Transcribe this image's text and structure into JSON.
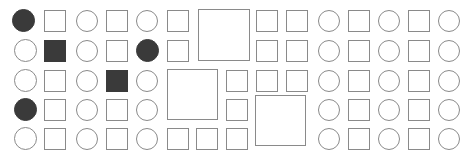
{
  "canvas": {
    "width": 470,
    "height": 159,
    "background": "#ffffff",
    "title": "shape-grid-pattern"
  },
  "style": {
    "outline_color": "#8a8a8a",
    "outline_width": 1,
    "fill_dark": "#3a3a3a",
    "fill_light": "#ffffff",
    "big_outline_color": "#8a8a8a",
    "big_outline_width": 1
  },
  "grid": {
    "rows": 5,
    "cols": 14,
    "cell_pitch_x": 30,
    "cell_pitch_y": 30,
    "origin_x": 10,
    "origin_y": 9,
    "small_size": 22,
    "column_x": [
      10,
      40,
      70,
      100,
      130,
      160,
      190,
      220,
      250,
      280,
      310,
      340,
      370,
      400,
      430
    ],
    "row_y": [
      9,
      39,
      69,
      99,
      128
    ]
  },
  "shapes": [
    {
      "id": "r0c0",
      "row": 0,
      "col": 0,
      "type": "circle",
      "fill": "dark",
      "x": 12,
      "y": 9,
      "size": 23
    },
    {
      "id": "r0c1",
      "row": 0,
      "col": 1,
      "type": "square",
      "fill": "light",
      "x": 44,
      "y": 10,
      "size": 22
    },
    {
      "id": "r0c2",
      "row": 0,
      "col": 2,
      "type": "circle",
      "fill": "light",
      "x": 76,
      "y": 10,
      "size": 22
    },
    {
      "id": "r0c3",
      "row": 0,
      "col": 3,
      "type": "square",
      "fill": "light",
      "x": 106,
      "y": 10,
      "size": 22
    },
    {
      "id": "r0c4",
      "row": 0,
      "col": 4,
      "type": "circle",
      "fill": "light",
      "x": 136,
      "y": 10,
      "size": 22
    },
    {
      "id": "r0c5",
      "row": 0,
      "col": 5,
      "type": "square",
      "fill": "light",
      "x": 167,
      "y": 10,
      "size": 22
    },
    {
      "id": "r0c7",
      "row": 0,
      "col": 7,
      "type": "square",
      "fill": "light",
      "x": 256,
      "y": 10,
      "size": 22
    },
    {
      "id": "r0c8",
      "row": 0,
      "col": 8,
      "type": "square",
      "fill": "light",
      "x": 286,
      "y": 10,
      "size": 22
    },
    {
      "id": "r0c9",
      "row": 0,
      "col": 9,
      "type": "circle",
      "fill": "light",
      "x": 318,
      "y": 10,
      "size": 22
    },
    {
      "id": "r0c10",
      "row": 0,
      "col": 10,
      "type": "square",
      "fill": "light",
      "x": 348,
      "y": 10,
      "size": 22
    },
    {
      "id": "r0c11",
      "row": 0,
      "col": 11,
      "type": "circle",
      "fill": "light",
      "x": 378,
      "y": 10,
      "size": 22
    },
    {
      "id": "r0c12",
      "row": 0,
      "col": 12,
      "type": "square",
      "fill": "light",
      "x": 408,
      "y": 10,
      "size": 22
    },
    {
      "id": "r0c13",
      "row": 0,
      "col": 13,
      "type": "circle",
      "fill": "light",
      "x": 438,
      "y": 10,
      "size": 22
    },
    {
      "id": "r1c0",
      "row": 1,
      "col": 0,
      "type": "circle",
      "fill": "light",
      "x": 14,
      "y": 39,
      "size": 23
    },
    {
      "id": "r1c1",
      "row": 1,
      "col": 1,
      "type": "square",
      "fill": "dark",
      "x": 44,
      "y": 40,
      "size": 22
    },
    {
      "id": "r1c2",
      "row": 1,
      "col": 2,
      "type": "circle",
      "fill": "light",
      "x": 76,
      "y": 40,
      "size": 22
    },
    {
      "id": "r1c3",
      "row": 1,
      "col": 3,
      "type": "square",
      "fill": "light",
      "x": 106,
      "y": 40,
      "size": 22
    },
    {
      "id": "r1c4",
      "row": 1,
      "col": 4,
      "type": "circle",
      "fill": "dark",
      "x": 136,
      "y": 39,
      "size": 23
    },
    {
      "id": "r1c5",
      "row": 1,
      "col": 5,
      "type": "square",
      "fill": "light",
      "x": 167,
      "y": 40,
      "size": 22
    },
    {
      "id": "r1c7",
      "row": 1,
      "col": 7,
      "type": "square",
      "fill": "light",
      "x": 256,
      "y": 40,
      "size": 22
    },
    {
      "id": "r1c8",
      "row": 1,
      "col": 8,
      "type": "square",
      "fill": "light",
      "x": 286,
      "y": 40,
      "size": 22
    },
    {
      "id": "r1c9",
      "row": 1,
      "col": 9,
      "type": "circle",
      "fill": "light",
      "x": 318,
      "y": 40,
      "size": 22
    },
    {
      "id": "r1c10",
      "row": 1,
      "col": 10,
      "type": "square",
      "fill": "light",
      "x": 348,
      "y": 40,
      "size": 22
    },
    {
      "id": "r1c11",
      "row": 1,
      "col": 11,
      "type": "circle",
      "fill": "light",
      "x": 378,
      "y": 40,
      "size": 22
    },
    {
      "id": "r1c12",
      "row": 1,
      "col": 12,
      "type": "square",
      "fill": "light",
      "x": 408,
      "y": 40,
      "size": 22
    },
    {
      "id": "r1c13",
      "row": 1,
      "col": 13,
      "type": "circle",
      "fill": "light",
      "x": 438,
      "y": 40,
      "size": 22
    },
    {
      "id": "r2c0",
      "row": 2,
      "col": 0,
      "type": "circle",
      "fill": "light",
      "x": 14,
      "y": 69,
      "size": 23
    },
    {
      "id": "r2c1",
      "row": 2,
      "col": 1,
      "type": "square",
      "fill": "light",
      "x": 44,
      "y": 70,
      "size": 22
    },
    {
      "id": "r2c2",
      "row": 2,
      "col": 2,
      "type": "circle",
      "fill": "light",
      "x": 76,
      "y": 70,
      "size": 22
    },
    {
      "id": "r2c3",
      "row": 2,
      "col": 3,
      "type": "square",
      "fill": "dark",
      "x": 106,
      "y": 70,
      "size": 22
    },
    {
      "id": "r2c4",
      "row": 2,
      "col": 4,
      "type": "circle",
      "fill": "light",
      "x": 136,
      "y": 70,
      "size": 22
    },
    {
      "id": "r2c6",
      "row": 2,
      "col": 6,
      "type": "square",
      "fill": "light",
      "x": 226,
      "y": 70,
      "size": 22
    },
    {
      "id": "r2c7",
      "row": 2,
      "col": 7,
      "type": "square",
      "fill": "light",
      "x": 256,
      "y": 70,
      "size": 22
    },
    {
      "id": "r2c8",
      "row": 2,
      "col": 8,
      "type": "square",
      "fill": "light",
      "x": 286,
      "y": 70,
      "size": 22
    },
    {
      "id": "r2c9",
      "row": 2,
      "col": 9,
      "type": "circle",
      "fill": "light",
      "x": 318,
      "y": 70,
      "size": 22
    },
    {
      "id": "r2c10",
      "row": 2,
      "col": 10,
      "type": "square",
      "fill": "light",
      "x": 348,
      "y": 70,
      "size": 22
    },
    {
      "id": "r2c11",
      "row": 2,
      "col": 11,
      "type": "circle",
      "fill": "light",
      "x": 378,
      "y": 70,
      "size": 22
    },
    {
      "id": "r2c12",
      "row": 2,
      "col": 12,
      "type": "square",
      "fill": "light",
      "x": 408,
      "y": 70,
      "size": 22
    },
    {
      "id": "r2c13",
      "row": 2,
      "col": 13,
      "type": "circle",
      "fill": "light",
      "x": 438,
      "y": 70,
      "size": 22
    },
    {
      "id": "r3c0",
      "row": 3,
      "col": 0,
      "type": "circle",
      "fill": "dark",
      "x": 14,
      "y": 98,
      "size": 23
    },
    {
      "id": "r3c1",
      "row": 3,
      "col": 1,
      "type": "square",
      "fill": "light",
      "x": 44,
      "y": 99,
      "size": 22
    },
    {
      "id": "r3c2",
      "row": 3,
      "col": 2,
      "type": "circle",
      "fill": "light",
      "x": 76,
      "y": 99,
      "size": 22
    },
    {
      "id": "r3c3",
      "row": 3,
      "col": 3,
      "type": "square",
      "fill": "light",
      "x": 106,
      "y": 99,
      "size": 22
    },
    {
      "id": "r3c4",
      "row": 3,
      "col": 4,
      "type": "circle",
      "fill": "light",
      "x": 136,
      "y": 99,
      "size": 22
    },
    {
      "id": "r3c6",
      "row": 3,
      "col": 6,
      "type": "square",
      "fill": "light",
      "x": 226,
      "y": 99,
      "size": 22
    },
    {
      "id": "r3c9",
      "row": 3,
      "col": 9,
      "type": "circle",
      "fill": "light",
      "x": 318,
      "y": 99,
      "size": 22
    },
    {
      "id": "r3c10",
      "row": 3,
      "col": 10,
      "type": "square",
      "fill": "light",
      "x": 348,
      "y": 99,
      "size": 22
    },
    {
      "id": "r3c11",
      "row": 3,
      "col": 11,
      "type": "circle",
      "fill": "light",
      "x": 378,
      "y": 99,
      "size": 22
    },
    {
      "id": "r3c12",
      "row": 3,
      "col": 12,
      "type": "square",
      "fill": "light",
      "x": 408,
      "y": 99,
      "size": 22
    },
    {
      "id": "r3c13",
      "row": 3,
      "col": 13,
      "type": "circle",
      "fill": "light",
      "x": 438,
      "y": 99,
      "size": 22
    },
    {
      "id": "r4c0",
      "row": 4,
      "col": 0,
      "type": "circle",
      "fill": "light",
      "x": 14,
      "y": 127,
      "size": 23
    },
    {
      "id": "r4c1",
      "row": 4,
      "col": 1,
      "type": "square",
      "fill": "light",
      "x": 44,
      "y": 128,
      "size": 22
    },
    {
      "id": "r4c2",
      "row": 4,
      "col": 2,
      "type": "circle",
      "fill": "light",
      "x": 76,
      "y": 128,
      "size": 22
    },
    {
      "id": "r4c3",
      "row": 4,
      "col": 3,
      "type": "square",
      "fill": "light",
      "x": 106,
      "y": 128,
      "size": 22
    },
    {
      "id": "r4c4",
      "row": 4,
      "col": 4,
      "type": "circle",
      "fill": "light",
      "x": 136,
      "y": 128,
      "size": 22
    },
    {
      "id": "r4c5",
      "row": 4,
      "col": 5,
      "type": "square",
      "fill": "light",
      "x": 167,
      "y": 128,
      "size": 22
    },
    {
      "id": "r4c6",
      "row": 4,
      "col": 6,
      "type": "square",
      "fill": "light",
      "x": 196,
      "y": 128,
      "size": 22
    },
    {
      "id": "r4c7",
      "row": 4,
      "col": 7,
      "type": "square",
      "fill": "light",
      "x": 226,
      "y": 128,
      "size": 22
    },
    {
      "id": "r4c9",
      "row": 4,
      "col": 9,
      "type": "circle",
      "fill": "light",
      "x": 318,
      "y": 128,
      "size": 22
    },
    {
      "id": "r4c10",
      "row": 4,
      "col": 10,
      "type": "square",
      "fill": "light",
      "x": 348,
      "y": 128,
      "size": 22
    },
    {
      "id": "r4c11",
      "row": 4,
      "col": 11,
      "type": "circle",
      "fill": "light",
      "x": 378,
      "y": 128,
      "size": 22
    },
    {
      "id": "r4c12",
      "row": 4,
      "col": 12,
      "type": "square",
      "fill": "light",
      "x": 408,
      "y": 128,
      "size": 22
    },
    {
      "id": "r4c13",
      "row": 4,
      "col": 13,
      "type": "circle",
      "fill": "light",
      "x": 438,
      "y": 128,
      "size": 22
    }
  ],
  "big_squares": [
    {
      "id": "big-1",
      "x": 198,
      "y": 9,
      "size": 52
    },
    {
      "id": "big-2",
      "x": 167,
      "y": 69,
      "size": 51
    },
    {
      "id": "big-3",
      "x": 255,
      "y": 95,
      "size": 51
    }
  ],
  "counts": {
    "total_small_shapes": 64,
    "dark_circles": 3,
    "dark_squares": 2,
    "big_squares": 3,
    "rows": 5,
    "cols": 14
  }
}
